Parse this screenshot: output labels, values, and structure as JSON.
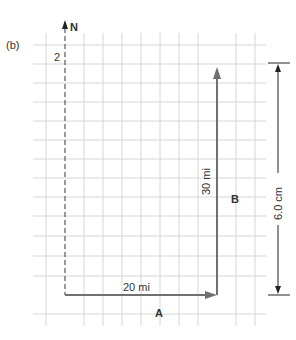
{
  "figure": {
    "panel_label": "(b)",
    "north_label": "N",
    "scale_tick_label": "2",
    "vector_a": {
      "name": "A",
      "magnitude_label": "20 mi"
    },
    "vector_b": {
      "name": "B",
      "magnitude_label": "30 mi"
    },
    "dimension_label": "6.0 cm"
  },
  "colors": {
    "grid": "#d4d4d4",
    "vector": "#707070",
    "text": "#333333",
    "dimension": "#222222"
  }
}
